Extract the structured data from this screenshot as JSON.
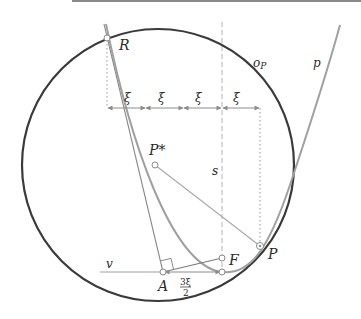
{
  "figure": {
    "labels": {
      "R": "R",
      "P": "P",
      "P_star": "P*",
      "F": "F",
      "A": "A",
      "v": "v",
      "s": "s",
      "o_P": "o",
      "o_P_sub": "P",
      "p": "p",
      "xi": "ξ",
      "frac_num": "3ξ",
      "frac_den": "2"
    },
    "xi_count": 4,
    "colors": {
      "circle": "#3a3a3a",
      "parabola": "#9a9a9a",
      "lines": "#7a7a7a",
      "arrows": "#8c8c8c",
      "dashed": "#b5b5b5",
      "background": "#ffffff"
    }
  }
}
